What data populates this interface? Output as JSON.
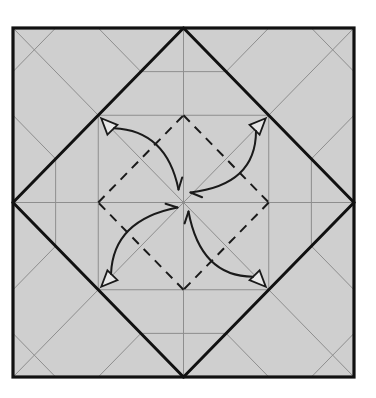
{
  "diagram": {
    "type": "origami-crease-pattern",
    "colors": {
      "paper": "#cfcfcf",
      "background": "#ffffff",
      "thin_crease": "#8e8e8e",
      "thick_line": "#111111",
      "arrow": "#1a1a1a"
    },
    "grid_divisions": 8,
    "elements": {
      "border": "square sheet outline",
      "diamond": "thick lines connecting edge midpoints",
      "valley_square": "dashed square connecting points 1/4 from center",
      "arrows": [
        {
          "name": "arrow-top-left",
          "from": "top-left diamond edge point",
          "to": "center"
        },
        {
          "name": "arrow-top-right",
          "from": "top-right diamond edge point",
          "to": "center"
        },
        {
          "name": "arrow-bottom-left",
          "from": "bottom-left diamond edge point",
          "to": "center"
        },
        {
          "name": "arrow-bottom-right",
          "from": "bottom-right diamond edge point",
          "to": "center"
        }
      ]
    }
  }
}
